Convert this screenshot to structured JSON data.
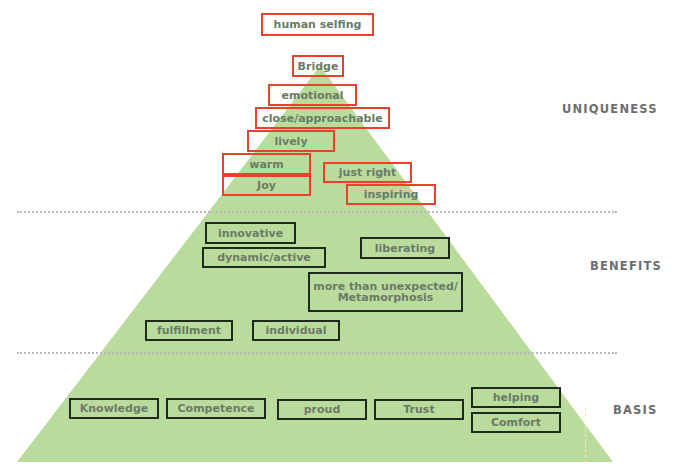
{
  "colors": {
    "pyramid_fill": "#b9dc9c",
    "uniqueness_border": "#e5432c",
    "lower_border": "#1e2a1c",
    "text": "#6b7a66",
    "label_text": "#6e6e6e"
  },
  "sections": {
    "uniqueness": "UNIQUENESS",
    "benefits": "BENEFITS",
    "basis": "BASIS"
  },
  "uniqueness": {
    "human_selfing": "human selfing",
    "bridge": "Bridge",
    "emotional": "emotional",
    "close_approachable": "close/approachable",
    "lively": "lively",
    "warm": "warm",
    "joy": "Joy",
    "just_right": "just right",
    "inspiring": "inspiring"
  },
  "benefits": {
    "innovative": "innovative",
    "dynamic_active": "dynamic/active",
    "liberating": "liberating",
    "metamorphosis": "more than unexpected/\nMetamorphosis",
    "fulfillment": "fulfillment",
    "individual": "individual"
  },
  "basis": {
    "knowledge": "Knowledge",
    "competence": "Competence",
    "proud": "proud",
    "trust": "Trust",
    "helping": "helping",
    "comfort": "Comfort"
  }
}
